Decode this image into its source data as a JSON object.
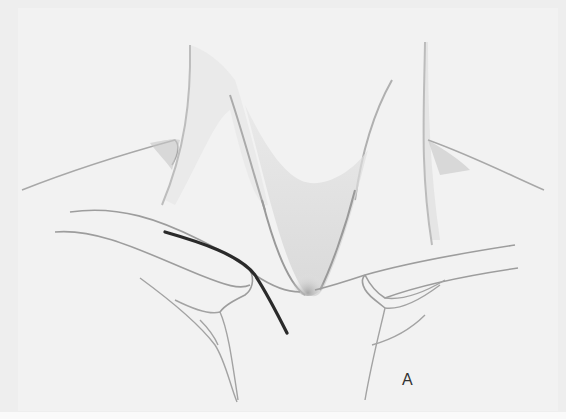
{
  "figure": {
    "panel_label": "A",
    "colors": {
      "background": "#f2f2f2",
      "line": "#9a9a9a",
      "shade": "#c8c8c8",
      "catheter": "#2a2a2a",
      "label": "#333333"
    }
  }
}
